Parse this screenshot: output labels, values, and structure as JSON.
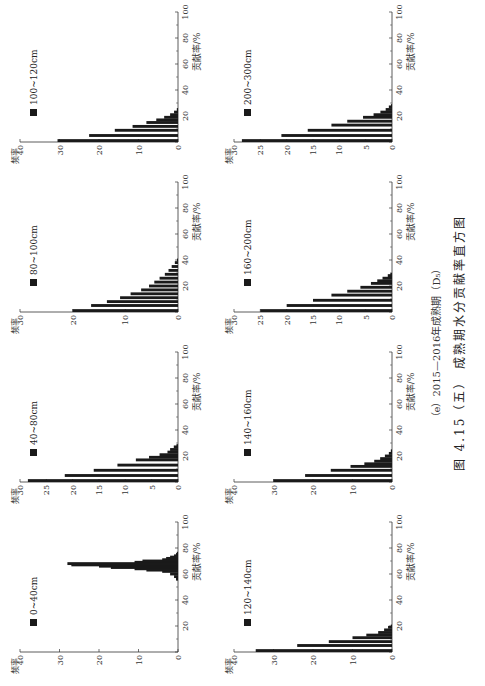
{
  "figure": {
    "subcaption": "（e）2015—2016年成熟期（D₅）",
    "caption": "图 4.15（五）  成熟期水分贡献率直方图"
  },
  "axis": {
    "xlabel": "贡献率/%",
    "ylabel": "频率",
    "xticks": [
      20,
      40,
      60,
      80,
      100
    ]
  },
  "chart_data": [
    {
      "type": "bar",
      "title": "0~40cm",
      "legend": "0~40cm",
      "xlabel": "贡献率/%",
      "ylabel": "频率",
      "xlim": [
        0,
        100
      ],
      "ylim": [
        0,
        40
      ],
      "yticks": [
        0,
        10,
        20,
        30,
        40
      ],
      "x": [
        56,
        58,
        60,
        62,
        63,
        64,
        65,
        66,
        67,
        68,
        69,
        70,
        71,
        72,
        73,
        74,
        75,
        76
      ],
      "values": [
        0.5,
        1,
        2,
        4,
        8,
        11,
        17,
        20,
        27,
        28,
        11,
        9,
        4,
        3,
        2,
        1,
        0.5,
        0.3
      ]
    },
    {
      "type": "bar",
      "title": "40~80cm",
      "legend": "40~80cm",
      "xlabel": "贡献率/%",
      "ylabel": "频率",
      "xlim": [
        0,
        100
      ],
      "ylim": [
        0,
        30
      ],
      "yticks": [
        0,
        5,
        10,
        15,
        20,
        25,
        30
      ],
      "x": [
        1,
        5,
        9,
        13,
        17,
        19,
        21,
        23,
        25,
        27,
        28
      ],
      "values": [
        28.5,
        21.5,
        16,
        11.5,
        8,
        5.5,
        3.5,
        2,
        1.5,
        0.8,
        0.3
      ]
    },
    {
      "type": "bar",
      "title": "80~100cm",
      "legend": "80~100cm",
      "xlabel": "贡献率/%",
      "ylabel": "频率",
      "xlim": [
        0,
        100
      ],
      "ylim": [
        0,
        30
      ],
      "yticks": [
        0,
        10,
        20,
        30
      ],
      "x": [
        1,
        5,
        8,
        11,
        14,
        17,
        20,
        23,
        26,
        29,
        32,
        35,
        38,
        40
      ],
      "values": [
        20,
        16.5,
        13.5,
        11,
        9,
        7,
        5.5,
        4.5,
        3.5,
        2.5,
        1.8,
        1.2,
        0.6,
        0.2
      ]
    },
    {
      "type": "bar",
      "title": "100~120cm",
      "legend": "100~120cm",
      "xlabel": "贡献率/%",
      "ylabel": "频率",
      "xlim": [
        0,
        100
      ],
      "ylim": [
        0,
        40
      ],
      "yticks": [
        0,
        10,
        20,
        30,
        40
      ],
      "x": [
        1,
        5,
        9,
        12,
        15,
        17,
        19,
        21,
        23,
        25
      ],
      "values": [
        30.5,
        22.5,
        16,
        11.5,
        8,
        5.5,
        3.5,
        2,
        1,
        0.3
      ]
    },
    {
      "type": "bar",
      "title": "120~140cm",
      "legend": "120~140cm",
      "xlabel": "贡献率/%",
      "ylabel": "频率",
      "xlim": [
        0,
        100
      ],
      "ylim": [
        0,
        40
      ],
      "yticks": [
        0,
        10,
        20,
        30,
        40
      ],
      "x": [
        1,
        5,
        8,
        11,
        13,
        15,
        17,
        19,
        20
      ],
      "values": [
        34.5,
        24,
        16,
        10,
        6.5,
        3.5,
        2,
        1,
        0.3
      ]
    },
    {
      "type": "bar",
      "title": "140~160cm",
      "legend": "140~160cm",
      "xlabel": "贡献率/%",
      "ylabel": "频率",
      "xlim": [
        0,
        100
      ],
      "ylim": [
        0,
        40
      ],
      "yticks": [
        0,
        10,
        20,
        30,
        40
      ],
      "x": [
        1,
        5,
        9,
        12,
        14,
        16,
        18,
        20,
        22,
        24
      ],
      "values": [
        30,
        22,
        15.5,
        10.5,
        7,
        4.5,
        3,
        1.8,
        0.8,
        0.3
      ]
    },
    {
      "type": "bar",
      "title": "160~200cm",
      "legend": "160~200cm",
      "xlabel": "贡献率/%",
      "ylabel": "频率",
      "xlim": [
        0,
        100
      ],
      "ylim": [
        0,
        30
      ],
      "yticks": [
        0,
        5,
        10,
        15,
        20,
        25,
        30
      ],
      "x": [
        1,
        5,
        9,
        13,
        16,
        19,
        22,
        24,
        26,
        28,
        29
      ],
      "values": [
        25,
        20,
        15,
        11.5,
        8.5,
        6,
        4,
        2.8,
        1.8,
        0.8,
        0.3
      ]
    },
    {
      "type": "bar",
      "title": "200~300cm",
      "legend": "200~300cm",
      "xlabel": "贡献率/%",
      "ylabel": "频率",
      "xlim": [
        0,
        100
      ],
      "ylim": [
        0,
        30
      ],
      "yticks": [
        0,
        5,
        10,
        15,
        20,
        25,
        30
      ],
      "x": [
        1,
        5,
        9,
        13,
        16,
        19,
        21,
        23,
        25,
        27,
        28
      ],
      "values": [
        28.5,
        21,
        16,
        11.5,
        8.5,
        5.5,
        3.5,
        2.2,
        1.2,
        0.6,
        0.2
      ]
    }
  ]
}
